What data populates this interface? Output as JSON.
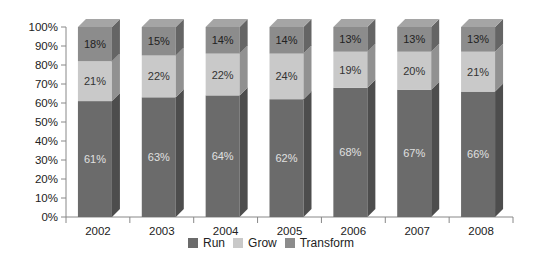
{
  "chart_data": {
    "type": "bar",
    "stacked": true,
    "style": "3d-stacked-100-percent",
    "title": "",
    "xlabel": "",
    "ylabel": "",
    "ylim": [
      0,
      100
    ],
    "y_ticks": [
      "0%",
      "10%",
      "20%",
      "30%",
      "40%",
      "50%",
      "60%",
      "70%",
      "80%",
      "90%",
      "100%"
    ],
    "categories": [
      "2002",
      "2003",
      "2004",
      "2005",
      "2006",
      "2007",
      "2008"
    ],
    "series": [
      {
        "name": "Run",
        "values": [
          61,
          63,
          64,
          62,
          68,
          67,
          66
        ],
        "labels": [
          "61%",
          "63%",
          "64%",
          "62%",
          "68%",
          "67%",
          "66%"
        ],
        "color": "#6b6b6b",
        "label_color": "#e0e0e0"
      },
      {
        "name": "Grow",
        "values": [
          21,
          22,
          22,
          24,
          19,
          20,
          21
        ],
        "labels": [
          "21%",
          "22%",
          "22%",
          "24%",
          "19%",
          "20%",
          "21%"
        ],
        "color": "#c9c9c9",
        "label_color": "#333333"
      },
      {
        "name": "Transform",
        "values": [
          18,
          15,
          14,
          14,
          13,
          13,
          13
        ],
        "labels": [
          "18%",
          "15%",
          "14%",
          "14%",
          "13%",
          "13%",
          "13%"
        ],
        "color": "#8c8c8c",
        "label_color": "#222222"
      }
    ],
    "legend": {
      "position": "bottom",
      "entries": [
        "Run",
        "Grow",
        "Transform"
      ]
    },
    "grid": false
  }
}
